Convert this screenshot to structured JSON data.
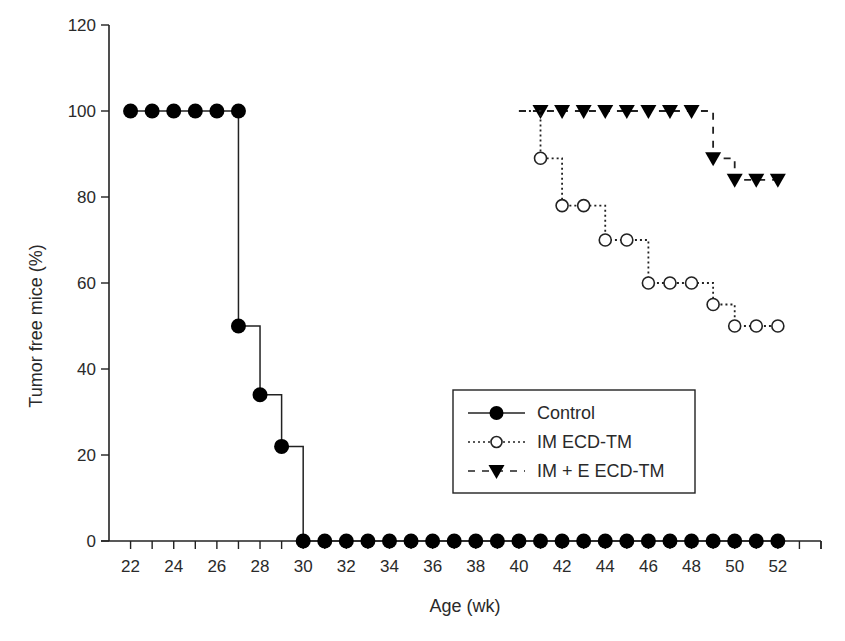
{
  "chart_data": {
    "type": "line",
    "subtype": "kaplan-meier step",
    "title": "",
    "xlabel": "Age (wk)",
    "ylabel": "Tumor free mice (%)",
    "xlim": [
      21,
      54
    ],
    "ylim": [
      0,
      120
    ],
    "x_ticks_major_labels": [
      22,
      24,
      26,
      28,
      30,
      32,
      34,
      36,
      38,
      40,
      42,
      44,
      46,
      48,
      50,
      52
    ],
    "x_minor_ticks": [
      22,
      23,
      24,
      25,
      26,
      27,
      28,
      29,
      30,
      31,
      32,
      33,
      34,
      35,
      36,
      37,
      38,
      39,
      40,
      41,
      42,
      43,
      44,
      45,
      46,
      47,
      48,
      49,
      50,
      51,
      52,
      53,
      54
    ],
    "y_ticks": [
      0,
      20,
      40,
      60,
      80,
      100,
      120
    ],
    "grid": false,
    "legend_position": "lower-right inside plot",
    "series": [
      {
        "name": "Control",
        "line_style": "solid",
        "marker": "filled-circle",
        "color": "#000000",
        "x": [
          22,
          23,
          24,
          25,
          26,
          27,
          27,
          28,
          29,
          30,
          31,
          32,
          33,
          34,
          35,
          36,
          37,
          38,
          39,
          40,
          41,
          42,
          43,
          44,
          45,
          46,
          47,
          48,
          49,
          50,
          51,
          52
        ],
        "y": [
          100,
          100,
          100,
          100,
          100,
          100,
          50,
          34,
          22,
          0,
          0,
          0,
          0,
          0,
          0,
          0,
          0,
          0,
          0,
          0,
          0,
          0,
          0,
          0,
          0,
          0,
          0,
          0,
          0,
          0,
          0,
          0
        ]
      },
      {
        "name": "IM ECD-TM",
        "line_style": "dotted",
        "marker": "open-circle",
        "color": "#000000",
        "x": [
          22,
          23,
          24,
          25,
          26,
          27,
          28,
          29,
          30,
          31,
          32,
          33,
          34,
          35,
          36,
          37,
          38,
          39,
          40,
          41,
          42,
          43,
          44,
          45,
          46,
          47,
          48,
          49,
          50,
          51,
          52
        ],
        "y": [
          100,
          100,
          100,
          100,
          100,
          100,
          100,
          100,
          100,
          100,
          100,
          100,
          100,
          100,
          100,
          100,
          100,
          100,
          100,
          89,
          78,
          78,
          70,
          70,
          60,
          60,
          60,
          55,
          50,
          50,
          50
        ]
      },
      {
        "name": "IM + E ECD-TM",
        "line_style": "dashed",
        "marker": "filled-triangle-down",
        "color": "#000000",
        "x": [
          22,
          23,
          24,
          25,
          26,
          27,
          28,
          29,
          30,
          31,
          32,
          33,
          34,
          35,
          36,
          37,
          38,
          39,
          40,
          41,
          42,
          43,
          44,
          45,
          46,
          47,
          48,
          49,
          50,
          51,
          52
        ],
        "y": [
          100,
          100,
          100,
          100,
          100,
          100,
          100,
          100,
          100,
          100,
          100,
          100,
          100,
          100,
          100,
          100,
          100,
          100,
          100,
          100,
          100,
          100,
          100,
          100,
          100,
          100,
          100,
          89,
          84,
          84,
          84
        ]
      }
    ]
  },
  "legend": {
    "items": [
      {
        "label": "Control"
      },
      {
        "label": "IM ECD-TM"
      },
      {
        "label": "IM + E ECD-TM"
      }
    ]
  }
}
